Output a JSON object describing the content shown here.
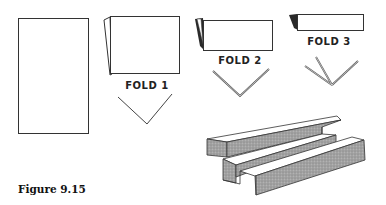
{
  "figure": {
    "caption": "Figure 9.15",
    "steps": [
      {
        "label": "FOLD 1"
      },
      {
        "label": "FOLD 2"
      },
      {
        "label": "FOLD 3"
      }
    ],
    "colors": {
      "line": "#333333",
      "shade": "#9a9a9a",
      "dark_fold": "#2a2a2a",
      "background": "#ffffff"
    }
  }
}
